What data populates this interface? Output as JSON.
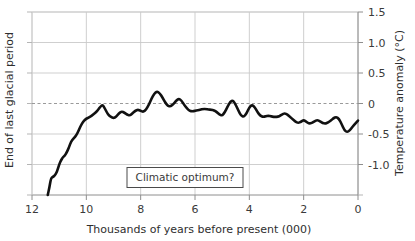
{
  "chart_data": {
    "type": "line",
    "title": "",
    "xlabel": "Thousands of years before present (000)",
    "ylabel": "Temperature anomaly (°C)",
    "left_axis_note": "End of last glacial period",
    "annotation": "Climatic optimum?",
    "xlim": [
      12,
      0
    ],
    "ylim": [
      -1.5,
      1.5
    ],
    "xticks": [
      "12",
      "10",
      "8",
      "6",
      "4",
      "2",
      "0"
    ],
    "xtick_values": [
      12,
      10,
      8,
      6,
      4,
      2,
      0
    ],
    "yticks": [
      "1.5",
      "1.0",
      "0.5",
      "0",
      "-0.5",
      "-1.0"
    ],
    "ytick_values": [
      1.5,
      1.0,
      0.5,
      0,
      -0.5,
      -1.0
    ],
    "grid": true,
    "zero_line": 0,
    "legend": "none",
    "line_color": "#111111",
    "grid_color": "#c9c9c9",
    "series": [
      {
        "name": "Temperature anomaly",
        "x": [
          11.42,
          11.36,
          11.3,
          11.22,
          11.16,
          11.08,
          11.0,
          10.92,
          10.86,
          10.8,
          10.72,
          10.64,
          10.56,
          10.48,
          10.42,
          10.34,
          10.26,
          10.2,
          10.12,
          10.04,
          9.96,
          9.88,
          9.8,
          9.72,
          9.64,
          9.56,
          9.48,
          9.4,
          9.32,
          9.24,
          9.16,
          9.08,
          9.0,
          8.9,
          8.8,
          8.7,
          8.6,
          8.5,
          8.4,
          8.3,
          8.2,
          8.1,
          8.0,
          7.9,
          7.8,
          7.7,
          7.6,
          7.5,
          7.4,
          7.3,
          7.2,
          7.1,
          7.0,
          6.9,
          6.8,
          6.7,
          6.6,
          6.5,
          6.4,
          6.3,
          6.2,
          6.1,
          6.0,
          5.9,
          5.8,
          5.7,
          5.6,
          5.5,
          5.4,
          5.3,
          5.2,
          5.1,
          5.0,
          4.9,
          4.8,
          4.7,
          4.6,
          4.5,
          4.4,
          4.3,
          4.2,
          4.1,
          4.0,
          3.9,
          3.8,
          3.7,
          3.6,
          3.5,
          3.4,
          3.3,
          3.2,
          3.1,
          3.0,
          2.9,
          2.8,
          2.7,
          2.6,
          2.5,
          2.4,
          2.3,
          2.2,
          2.1,
          2.0,
          1.9,
          1.8,
          1.7,
          1.6,
          1.5,
          1.4,
          1.3,
          1.2,
          1.1,
          1.0,
          0.9,
          0.8,
          0.7,
          0.6,
          0.5,
          0.4,
          0.3,
          0.2,
          0.1,
          0.0
        ],
        "values": [
          -1.5,
          -1.38,
          -1.22,
          -1.2,
          -1.18,
          -1.12,
          -1.0,
          -0.92,
          -0.88,
          -0.86,
          -0.8,
          -0.72,
          -0.62,
          -0.58,
          -0.55,
          -0.5,
          -0.42,
          -0.36,
          -0.3,
          -0.26,
          -0.24,
          -0.22,
          -0.2,
          -0.17,
          -0.14,
          -0.1,
          -0.05,
          -0.02,
          -0.08,
          -0.15,
          -0.2,
          -0.22,
          -0.24,
          -0.22,
          -0.16,
          -0.13,
          -0.15,
          -0.18,
          -0.2,
          -0.16,
          -0.12,
          -0.1,
          -0.12,
          -0.14,
          -0.1,
          -0.02,
          0.08,
          0.16,
          0.2,
          0.17,
          0.1,
          0.02,
          -0.04,
          -0.05,
          -0.01,
          0.04,
          0.08,
          0.05,
          -0.02,
          -0.08,
          -0.12,
          -0.13,
          -0.12,
          -0.11,
          -0.1,
          -0.09,
          -0.09,
          -0.1,
          -0.1,
          -0.11,
          -0.14,
          -0.18,
          -0.2,
          -0.14,
          -0.05,
          0.03,
          0.05,
          -0.02,
          -0.12,
          -0.2,
          -0.22,
          -0.16,
          -0.06,
          -0.02,
          -0.06,
          -0.14,
          -0.2,
          -0.22,
          -0.21,
          -0.2,
          -0.21,
          -0.22,
          -0.22,
          -0.21,
          -0.18,
          -0.16,
          -0.18,
          -0.22,
          -0.26,
          -0.3,
          -0.32,
          -0.3,
          -0.27,
          -0.3,
          -0.33,
          -0.32,
          -0.29,
          -0.27,
          -0.29,
          -0.32,
          -0.33,
          -0.31,
          -0.28,
          -0.24,
          -0.22,
          -0.25,
          -0.34,
          -0.44,
          -0.47,
          -0.44,
          -0.38,
          -0.33,
          -0.28
        ]
      }
    ]
  }
}
